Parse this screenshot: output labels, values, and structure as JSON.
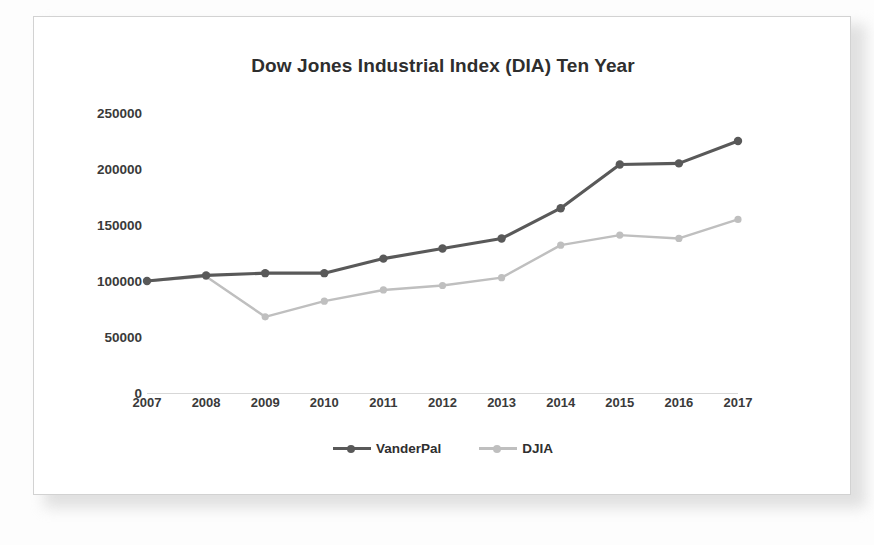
{
  "chart_data": {
    "type": "line",
    "title": "Dow Jones Industrial Index (DIA) Ten Year",
    "xlabel": "",
    "ylabel": "",
    "categories": [
      "2007",
      "2008",
      "2009",
      "2010",
      "2011",
      "2012",
      "2013",
      "2014",
      "2015",
      "2016",
      "2017"
    ],
    "ylim": [
      0,
      250000
    ],
    "ytick_labels": [
      "250000",
      "200000",
      "150000",
      "100000",
      "50000",
      "0"
    ],
    "ytick_values": [
      250000,
      200000,
      150000,
      100000,
      50000,
      0
    ],
    "grid": false,
    "legend_position": "bottom",
    "series": [
      {
        "name": "VanderPal",
        "color": "#595959",
        "marker": "circle",
        "values": [
          100000,
          105000,
          107000,
          107000,
          120000,
          129000,
          138000,
          165000,
          204000,
          205000,
          225000
        ]
      },
      {
        "name": "DJIA",
        "color": "#bfbfbf",
        "marker": "circle",
        "values": [
          100000,
          104000,
          68000,
          82000,
          92000,
          96000,
          103000,
          132000,
          141000,
          138000,
          155000
        ]
      }
    ]
  },
  "legend": {
    "entries": [
      {
        "label": "VanderPal"
      },
      {
        "label": "DJIA"
      }
    ]
  }
}
